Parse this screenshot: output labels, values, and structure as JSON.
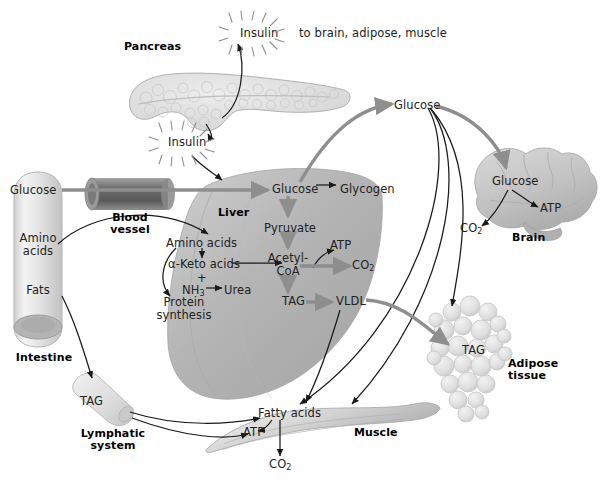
{
  "figure": {
    "background": "#ffffff",
    "width": 609,
    "height": 485
  },
  "palette": {
    "arrow_thin": "#1a1a1a",
    "arrow_thick_grey": "#8e8e8e",
    "organ_grey": "#b9b9b9",
    "organ_grey_dark": "#9a9a9a",
    "organ_light": "#dcdcdc",
    "vessel_grey": "#8a8a8a",
    "text": "#222222"
  },
  "organs": [
    {
      "id": "pancreas",
      "label": "Pancreas",
      "label_x": 155,
      "label_y": 41
    },
    {
      "id": "intestine",
      "label": "Intestine",
      "label_x": 44,
      "label_y": 352
    },
    {
      "id": "liver",
      "label": "Liver",
      "label_x": 229,
      "label_y": 211
    },
    {
      "id": "brain",
      "label": "Brain",
      "label_x": 529,
      "label_y": 237
    },
    {
      "id": "muscle",
      "label": "Muscle",
      "label_x": 376,
      "label_y": 432
    },
    {
      "id": "adipose",
      "label": "Adipose\ntissue",
      "label_x": 508,
      "label_y": 363
    },
    {
      "id": "lymphatic",
      "label": "Lymphatic\nsystem",
      "label_x": 113,
      "label_y": 430
    },
    {
      "id": "vessel",
      "label": "Blood\nvessel",
      "label_x": 126,
      "label_y": 213
    }
  ],
  "metabolites": {
    "insulin_top": {
      "text": "Insulin",
      "x": 262,
      "y": 33
    },
    "insulin_targets": {
      "text": "to brain, adipose, muscle",
      "x": 303,
      "y": 33
    },
    "insulin_lower": {
      "text": "Insulin",
      "x": 190,
      "y": 143
    },
    "intestine_glucose": {
      "text": "Glucose",
      "x": 10,
      "y": 187
    },
    "intestine_amino": {
      "text": "Amino\nacids",
      "x": 20,
      "y": 237
    },
    "intestine_fats": {
      "text": "Fats",
      "x": 28,
      "y": 288
    },
    "liver_glucose": {
      "text": "Glucose",
      "x": 280,
      "y": 188
    },
    "liver_glycogen": {
      "text": "Glycogen",
      "x": 344,
      "y": 188
    },
    "liver_pyruvate": {
      "text": "Pyruvate",
      "x": 278,
      "y": 227
    },
    "liver_acetyl": {
      "text": "Acetyl-\nCoA",
      "x": 287,
      "y": 257
    },
    "liver_atp": {
      "text": "ATP",
      "x": 336,
      "y": 244
    },
    "liver_co2": {
      "text": "CO2",
      "x": 360,
      "y": 265
    },
    "liver_amino": {
      "text": "Amino acids",
      "x": 170,
      "y": 242
    },
    "liver_ketoacids": {
      "text": "α-Keto acids",
      "x": 172,
      "y": 264
    },
    "liver_plus": {
      "text": "+",
      "x": 200,
      "y": 279
    },
    "liver_nh3": {
      "text": "NH3",
      "x": 190,
      "y": 291
    },
    "liver_urea": {
      "text": "Urea",
      "x": 228,
      "y": 291
    },
    "liver_protein": {
      "text": "Protein\nsynthesis",
      "x": 164,
      "y": 302
    },
    "liver_tag": {
      "text": "TAG",
      "x": 288,
      "y": 300
    },
    "liver_vldl": {
      "text": "VLDL",
      "x": 342,
      "y": 301
    },
    "hub_glucose": {
      "text": "Glucose",
      "x": 402,
      "y": 104
    },
    "brain_glucose": {
      "text": "Glucose",
      "x": 508,
      "y": 180
    },
    "brain_atp": {
      "text": "ATP",
      "x": 546,
      "y": 210
    },
    "brain_co2": {
      "text": "CO2",
      "x": 468,
      "y": 228
    },
    "adipose_tag": {
      "text": "TAG",
      "x": 469,
      "y": 350
    },
    "lymph_tag": {
      "text": "TAG",
      "x": 84,
      "y": 401
    },
    "muscle_fatty": {
      "text": "Fatty acids",
      "x": 263,
      "y": 412
    },
    "muscle_atp": {
      "text": "ATP",
      "x": 251,
      "y": 432
    },
    "muscle_co2": {
      "text": "CO2",
      "x": 276,
      "y": 464
    }
  },
  "arrows": [
    {
      "id": "pancreas-to-insulin-top",
      "from": "pancreas",
      "to": "insulin_top",
      "style": "thin"
    },
    {
      "id": "pancreas-to-insulin-lower",
      "from": "pancreas",
      "to": "insulin_lower",
      "style": "thin"
    },
    {
      "id": "insulin-to-liver",
      "from": "insulin_lower",
      "to": "liver",
      "style": "thin"
    },
    {
      "id": "intestine-glucose-to-liver",
      "from": "intestine_glucose",
      "to": "liver_glucose",
      "style": "thick"
    },
    {
      "id": "intestine-amino-to-liver",
      "from": "intestine_amino",
      "to": "liver_amino",
      "style": "thin"
    },
    {
      "id": "intestine-fats-to-lymph",
      "from": "intestine_fats",
      "to": "lymph_tag",
      "style": "thin"
    },
    {
      "id": "liver-glucose-to-glycogen",
      "from": "liver_glucose",
      "to": "liver_glycogen",
      "style": "thin"
    },
    {
      "id": "liver-glucose-to-pyruvate",
      "from": "liver_glucose",
      "to": "liver_pyruvate",
      "style": "thick"
    },
    {
      "id": "pyruvate-to-acetyl",
      "from": "liver_pyruvate",
      "to": "liver_acetyl",
      "style": "thick"
    },
    {
      "id": "acetyl-to-co2",
      "from": "liver_acetyl",
      "to": "liver_co2",
      "style": "thick"
    },
    {
      "id": "acetyl-to-atp",
      "from": "liver_acetyl",
      "to": "liver_atp",
      "style": "thin"
    },
    {
      "id": "acetyl-to-tag",
      "from": "liver_acetyl",
      "to": "liver_tag",
      "style": "thick"
    },
    {
      "id": "tag-to-vldl",
      "from": "liver_tag",
      "to": "liver_vldl",
      "style": "thick"
    },
    {
      "id": "amino-to-ketoacids",
      "from": "liver_amino",
      "to": "liver_ketoacids",
      "style": "thin"
    },
    {
      "id": "ketoacids-to-acetyl",
      "from": "liver_ketoacids",
      "to": "liver_acetyl",
      "style": "thin"
    },
    {
      "id": "nh3-to-urea",
      "from": "liver_nh3",
      "to": "liver_urea",
      "style": "thin"
    },
    {
      "id": "amino-to-protein",
      "from": "liver_amino",
      "to": "liver_protein",
      "style": "thin"
    },
    {
      "id": "liver-glucose-to-hub",
      "from": "liver_glucose",
      "to": "hub_glucose",
      "style": "thick"
    },
    {
      "id": "hub-to-brain-glucose",
      "from": "hub_glucose",
      "to": "brain_glucose",
      "style": "thick"
    },
    {
      "id": "hub-to-muscle",
      "from": "hub_glucose",
      "to": "muscle_fatty",
      "style": "thin"
    },
    {
      "id": "hub-to-adipose",
      "from": "hub_glucose",
      "to": "adipose_tag",
      "style": "thin"
    },
    {
      "id": "brain-glucose-to-atp",
      "from": "brain_glucose",
      "to": "brain_atp",
      "style": "thin"
    },
    {
      "id": "brain-glucose-to-co2",
      "from": "brain_glucose",
      "to": "brain_co2",
      "style": "thin"
    },
    {
      "id": "vldl-to-adipose-tag",
      "from": "liver_vldl",
      "to": "adipose_tag",
      "style": "thick"
    },
    {
      "id": "lymph-tag-to-muscle",
      "from": "lymph_tag",
      "to": "muscle_fatty",
      "style": "thin"
    },
    {
      "id": "muscle-fatty-to-atp",
      "from": "muscle_fatty",
      "to": "muscle_atp",
      "style": "thin"
    },
    {
      "id": "muscle-fatty-to-co2",
      "from": "muscle_fatty",
      "to": "muscle_co2",
      "style": "thin"
    }
  ]
}
